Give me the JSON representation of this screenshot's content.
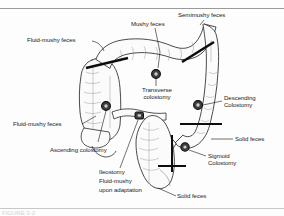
{
  "figure": {
    "caption_partial": "FIGURE 3-2",
    "colors": {
      "ink": "#1c1c1c",
      "stoma_fill": "#4a4a4a",
      "stoma_ring": "#101010",
      "bowel_outline": "#2a2a2a",
      "bowel_fill": "#fbfbfb",
      "rule": "#9a9a9a"
    }
  },
  "labels": {
    "mushy_feces": "Mushy feces",
    "semimushy_feces": "Semimushy feces",
    "fluid_mushy_feces_top": "Fluid-mushy feces",
    "fluid_mushy_feces_left": "Fluid-mushy feces",
    "transverse_colostomy_line1": "Transverse",
    "transverse_colostomy_line2": "colostomy",
    "descending_colostomy_line1": "Descending",
    "descending_colostomy_line2": "Colostomy",
    "sigmoid_colostomy_line1": "Sigmoid",
    "sigmoid_colostomy_line2": "Colostomy",
    "ascending_colostomy": "Ascending colostomy",
    "solid_feces_right": "Solid feces",
    "solid_feces_bottom": "Solid feces",
    "ileostomy_line1": "Ileostomy",
    "ileostomy_line2": "Fluid-mushy",
    "ileostomy_line3": "upon adaptation"
  },
  "stoma_sites": [
    {
      "name": "transverse-colostomy-stoma",
      "x": 156,
      "y": 74
    },
    {
      "name": "ascending-colostomy-stoma",
      "x": 106,
      "y": 106
    },
    {
      "name": "ileostomy-stoma",
      "x": 139,
      "y": 116
    },
    {
      "name": "descending-colostomy-stoma",
      "x": 198,
      "y": 105
    },
    {
      "name": "sigmoid-colostomy-stoma",
      "x": 185,
      "y": 147
    }
  ]
}
